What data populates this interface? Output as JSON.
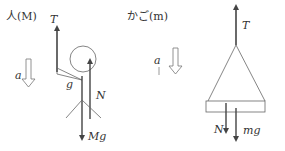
{
  "person": {
    "title": "人(M)",
    "tension_label": "T",
    "gravity_symbol_label": "g",
    "normal_label": "N",
    "weight_label": "Mg",
    "accel_label": "a"
  },
  "basket": {
    "title": "かご(m)",
    "tension_label": "T",
    "normal_label": "N",
    "weight_label": "mg",
    "accel_label": "a"
  },
  "colors": {
    "line": "#555555",
    "arrow": "#444444",
    "text": "#333333"
  }
}
